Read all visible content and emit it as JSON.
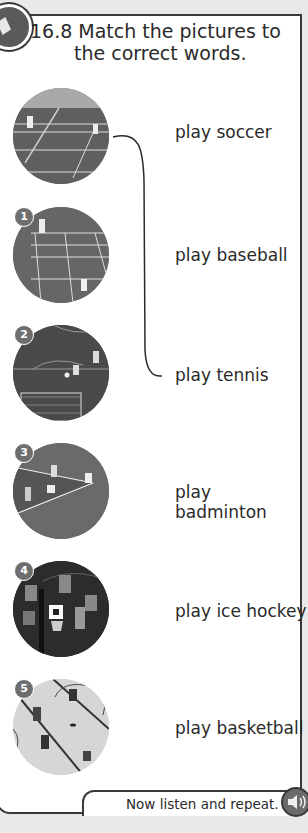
{
  "exercise": {
    "number": "16.8",
    "title_line1": "Match the pictures to",
    "title_line2": "the correct words."
  },
  "pictures": [
    {
      "badge": "",
      "sport": "tennis",
      "icon": "tennis-court-photo"
    },
    {
      "badge": "1",
      "sport": "badminton",
      "icon": "badminton-court-photo"
    },
    {
      "badge": "2",
      "sport": "soccer",
      "icon": "soccer-goal-photo"
    },
    {
      "badge": "3",
      "sport": "baseball",
      "icon": "baseball-field-photo"
    },
    {
      "badge": "4",
      "sport": "basketball",
      "icon": "wheelchair-basketball-photo"
    },
    {
      "badge": "5",
      "sport": "ice hockey",
      "icon": "ice-hockey-rink-photo"
    }
  ],
  "words": [
    "play soccer",
    "play baseball",
    "play tennis",
    "play badminton",
    "play ice hockey",
    "play basketball"
  ],
  "example_match": {
    "picture_index": 0,
    "word": "play tennis"
  },
  "footer": {
    "instruction": "Now listen and repeat.",
    "audio_icon": "speaker-icon"
  },
  "colors": {
    "panel_border": "#3a3a3a",
    "badge": "#6e6e6e",
    "background": "#e9e9e9"
  }
}
